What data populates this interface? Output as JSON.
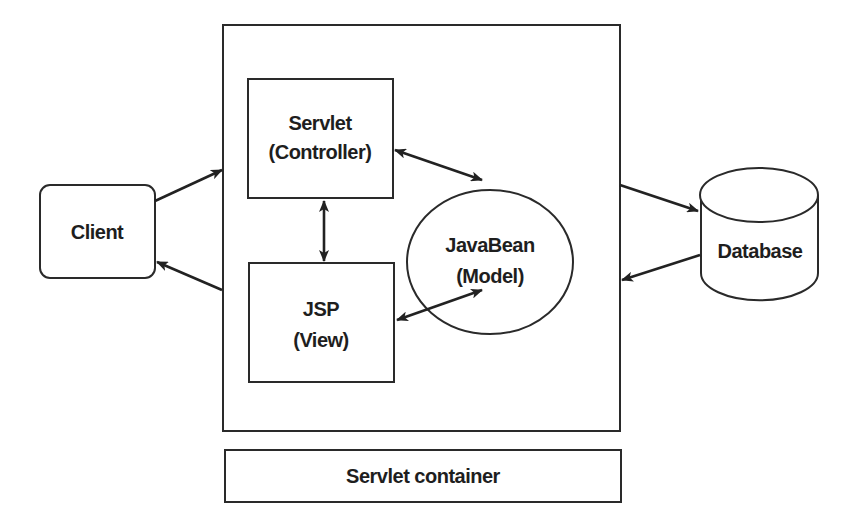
{
  "diagram": {
    "nodes": {
      "client": {
        "label": "Client"
      },
      "servlet": {
        "line1": "Servlet",
        "line2": "(Controller)"
      },
      "jsp": {
        "line1": "JSP",
        "line2": "(View)"
      },
      "javabean": {
        "line1": "JavaBean",
        "line2": "(Model)"
      },
      "database": {
        "label": "Database"
      },
      "container": {
        "label": "Servlet container"
      }
    },
    "edges": [
      {
        "from": "client",
        "to": "container",
        "direction": "one-way"
      },
      {
        "from": "container",
        "to": "client",
        "direction": "one-way"
      },
      {
        "from": "servlet",
        "to": "javabean",
        "direction": "bidirectional"
      },
      {
        "from": "servlet",
        "to": "jsp",
        "direction": "bidirectional"
      },
      {
        "from": "jsp",
        "to": "javabean",
        "direction": "bidirectional"
      },
      {
        "from": "container",
        "to": "database",
        "direction": "one-way"
      },
      {
        "from": "database",
        "to": "container",
        "direction": "one-way"
      }
    ],
    "colors": {
      "stroke": "#2a2a2a",
      "text": "#1e1e1e",
      "background": "#ffffff"
    }
  }
}
